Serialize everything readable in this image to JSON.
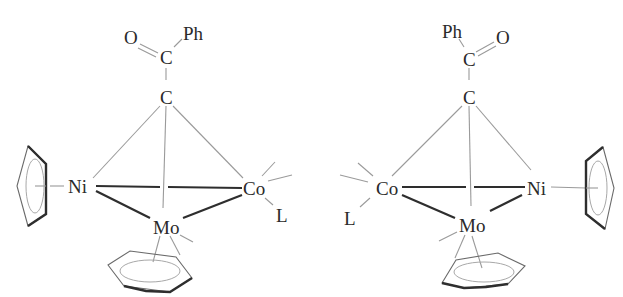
{
  "diagram": {
    "type": "chemical-structure",
    "molecules": [
      {
        "name": "left-enantiomer",
        "labels": {
          "oxygen": "O",
          "phenyl": "Ph",
          "carbonyl_carbon": "C",
          "cluster_carbon": "C",
          "nickel": "Ni",
          "cobalt": "Co",
          "ligand": "L",
          "molybdenum": "Mo"
        }
      },
      {
        "name": "right-enantiomer",
        "labels": {
          "oxygen": "O",
          "phenyl": "Ph",
          "carbonyl_carbon": "C",
          "cluster_carbon": "C",
          "nickel": "Ni",
          "cobalt": "Co",
          "ligand": "L",
          "molybdenum": "Mo"
        }
      }
    ]
  }
}
